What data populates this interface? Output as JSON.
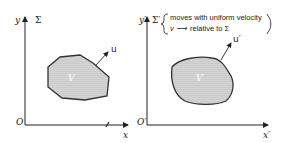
{
  "left_frame": {
    "y_label": "y",
    "frame_label": "Σ",
    "origin_label": "O",
    "x_label": "x",
    "volume_label": "V",
    "velocity_label": "u"
  },
  "right_frame": {
    "y_label": "y′",
    "frame_label": "Σ′",
    "origin_label": "O′",
    "x_label": "x′",
    "volume_label": "V′",
    "velocity_label": "u′",
    "annotation_line1": "moves with uniform velocity",
    "annotation_line2_prefix": "v ⟶",
    "annotation_line2": "relative to Σ"
  },
  "colors": {
    "ink": "#222222",
    "fill": "#c8c8c8"
  }
}
